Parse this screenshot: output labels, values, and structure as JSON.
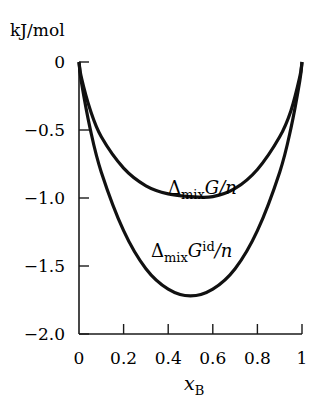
{
  "chart_data": {
    "type": "line",
    "title": "",
    "ylabel": "kJ/mol",
    "xlabel": "x_B",
    "xlabel_main": "x",
    "xlabel_sub": "B",
    "xlim": [
      0,
      1
    ],
    "ylim": [
      -2.0,
      0
    ],
    "x_ticks": [
      "0",
      "0.2",
      "0.4",
      "0.6",
      "0.8",
      "1"
    ],
    "x_tick_values": [
      0,
      0.2,
      0.4,
      0.6,
      0.8,
      1
    ],
    "y_ticks": [
      "0",
      "−0.5",
      "−1.0",
      "−1.5",
      "−2.0"
    ],
    "y_tick_values": [
      0,
      -0.5,
      -1.0,
      -1.5,
      -2.0
    ],
    "grid": false,
    "legend": "inline annotations",
    "x": [
      0,
      0.01,
      0.05,
      0.1,
      0.2,
      0.3,
      0.4,
      0.5,
      0.6,
      0.7,
      0.8,
      0.9,
      0.95,
      0.99,
      1
    ],
    "series": [
      {
        "name": "ΔmixG/n",
        "label_main": "Δ",
        "label_sub": "mix",
        "label_rest": "G/n",
        "values": [
          0,
          -0.11,
          -0.35,
          -0.55,
          -0.78,
          -0.91,
          -0.97,
          -0.99,
          -0.99,
          -0.93,
          -0.79,
          -0.55,
          -0.36,
          -0.11,
          0
        ]
      },
      {
        "name": "ΔmixG^id/n",
        "label_main": "Δ",
        "label_sub": "mix",
        "label_G": "G",
        "label_sup": "id",
        "label_rest": "/n",
        "values": [
          0,
          -0.14,
          -0.49,
          -0.81,
          -1.24,
          -1.52,
          -1.67,
          -1.72,
          -1.67,
          -1.52,
          -1.24,
          -0.81,
          -0.49,
          -0.14,
          0
        ]
      }
    ]
  }
}
